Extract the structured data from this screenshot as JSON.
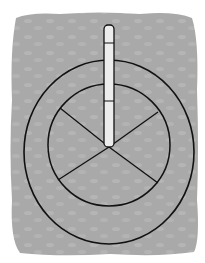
{
  "illustration": {
    "subject": "circular stone structure with central post, top-down view",
    "colors": {
      "background": "#ffffff",
      "ground": "#a9a9a9",
      "ground_speckle": "#b6b6b6",
      "outline": "#111111",
      "post": "#ececec"
    },
    "ground": {
      "x": 10,
      "y": 12,
      "width": 188,
      "height": 243
    },
    "outer_ring": {
      "cx": 109,
      "cy": 152,
      "rx": 85,
      "ry": 92
    },
    "inner_circle": {
      "cx": 109,
      "cy": 145,
      "r": 61
    },
    "hub": {
      "x": 109,
      "y": 147
    },
    "spokes": [
      {
        "x": 60,
        "y": 108
      },
      {
        "x": 158,
        "y": 112
      },
      {
        "x": 58,
        "y": 180
      },
      {
        "x": 158,
        "y": 183
      }
    ],
    "post": {
      "x": 104,
      "y": 25,
      "width": 11,
      "height": 122,
      "joints": [
        43,
        101
      ]
    }
  }
}
